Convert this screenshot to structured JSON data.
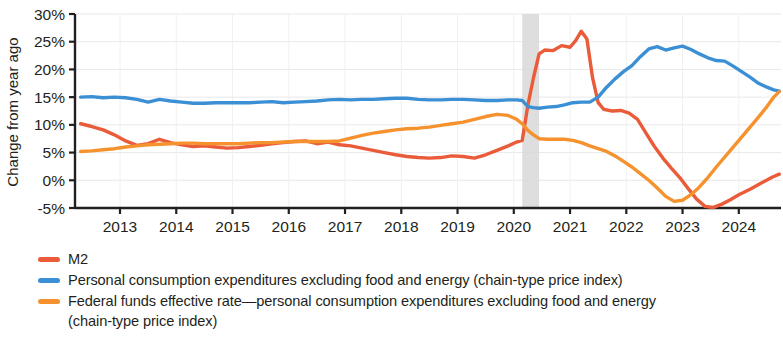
{
  "chart_data": {
    "type": "line",
    "title": "",
    "xlabel": "",
    "ylabel": "Change from year ago",
    "ylim": [
      -5,
      30
    ],
    "xlim": [
      2012.2,
      2024.75
    ],
    "grid": true,
    "legend_position": "below",
    "y_ticks": [
      "30%",
      "25%",
      "20%",
      "15%",
      "10%",
      "5%",
      "0%",
      "-5%"
    ],
    "y_tick_values": [
      30,
      25,
      20,
      15,
      10,
      5,
      0,
      -5
    ],
    "x_ticks": [
      "2013",
      "2014",
      "2015",
      "2016",
      "2017",
      "2018",
      "2019",
      "2020",
      "2021",
      "2022",
      "2023",
      "2024"
    ],
    "x_tick_values": [
      2013,
      2014,
      2015,
      2016,
      2017,
      2018,
      2019,
      2020,
      2021,
      2022,
      2023,
      2024
    ],
    "annotations": [
      {
        "name": "recession-band",
        "type": "vspan",
        "x0": 2020.15,
        "x1": 2020.45,
        "color": "#d8d8d8"
      }
    ],
    "series": [
      {
        "name": "M2",
        "color": "#ea5b3a",
        "x": [
          2012.3,
          2012.5,
          2012.7,
          2012.9,
          2013.1,
          2013.3,
          2013.5,
          2013.7,
          2013.9,
          2014.1,
          2014.3,
          2014.5,
          2014.7,
          2014.9,
          2015.1,
          2015.3,
          2015.5,
          2015.7,
          2015.9,
          2016.1,
          2016.3,
          2016.5,
          2016.7,
          2016.9,
          2017.1,
          2017.3,
          2017.5,
          2017.7,
          2017.9,
          2018.1,
          2018.3,
          2018.5,
          2018.7,
          2018.9,
          2019.1,
          2019.3,
          2019.5,
          2019.7,
          2019.9,
          2020.05,
          2020.15,
          2020.25,
          2020.35,
          2020.45,
          2020.55,
          2020.7,
          2020.85,
          2021.0,
          2021.1,
          2021.2,
          2021.3,
          2021.4,
          2021.5,
          2021.6,
          2021.75,
          2021.9,
          2022.05,
          2022.2,
          2022.35,
          2022.5,
          2022.65,
          2022.8,
          2022.95,
          2023.1,
          2023.25,
          2023.4,
          2023.55,
          2023.7,
          2023.85,
          2024.0,
          2024.2,
          2024.4,
          2024.6,
          2024.72
        ],
        "values": [
          10.2,
          9.7,
          9.1,
          8.2,
          7.1,
          6.3,
          6.6,
          7.4,
          6.8,
          6.4,
          6.1,
          6.2,
          6.0,
          5.8,
          5.9,
          6.1,
          6.3,
          6.6,
          6.8,
          7.0,
          7.1,
          6.6,
          6.9,
          6.4,
          6.2,
          5.8,
          5.4,
          5.0,
          4.6,
          4.3,
          4.1,
          4.0,
          4.1,
          4.4,
          4.3,
          4.0,
          4.6,
          5.4,
          6.2,
          6.9,
          7.2,
          13.5,
          18.5,
          22.8,
          23.5,
          23.4,
          24.3,
          24.0,
          25.2,
          26.9,
          25.5,
          18.5,
          14.0,
          12.8,
          12.5,
          12.6,
          12.1,
          11.0,
          8.5,
          6.1,
          4.0,
          2.2,
          0.5,
          -1.5,
          -3.4,
          -4.7,
          -4.9,
          -4.3,
          -3.5,
          -2.6,
          -1.6,
          -0.5,
          0.6,
          1.1
        ]
      },
      {
        "name": "Personal consumption expenditures excluding food and energy (chain-type price index)",
        "color": "#3b8fd4",
        "x": [
          2012.3,
          2012.5,
          2012.7,
          2012.9,
          2013.1,
          2013.3,
          2013.5,
          2013.7,
          2013.9,
          2014.1,
          2014.3,
          2014.5,
          2014.7,
          2014.9,
          2015.1,
          2015.3,
          2015.5,
          2015.7,
          2015.9,
          2016.1,
          2016.3,
          2016.5,
          2016.7,
          2016.9,
          2017.1,
          2017.3,
          2017.5,
          2017.7,
          2017.9,
          2018.1,
          2018.3,
          2018.5,
          2018.7,
          2018.9,
          2019.1,
          2019.3,
          2019.5,
          2019.7,
          2019.9,
          2020.05,
          2020.15,
          2020.25,
          2020.35,
          2020.45,
          2020.6,
          2020.75,
          2020.9,
          2021.05,
          2021.2,
          2021.35,
          2021.5,
          2021.65,
          2021.8,
          2021.95,
          2022.1,
          2022.25,
          2022.4,
          2022.55,
          2022.7,
          2022.85,
          2023.0,
          2023.15,
          2023.3,
          2023.45,
          2023.6,
          2023.75,
          2023.9,
          2024.05,
          2024.2,
          2024.35,
          2024.5,
          2024.62,
          2024.72
        ],
        "values": [
          15.0,
          15.1,
          14.9,
          15.0,
          14.9,
          14.6,
          14.1,
          14.6,
          14.3,
          14.1,
          13.9,
          13.9,
          14.0,
          14.0,
          14.0,
          14.0,
          14.1,
          14.2,
          14.0,
          14.1,
          14.2,
          14.3,
          14.5,
          14.6,
          14.5,
          14.6,
          14.6,
          14.7,
          14.8,
          14.8,
          14.6,
          14.5,
          14.5,
          14.6,
          14.6,
          14.5,
          14.4,
          14.4,
          14.5,
          14.5,
          14.4,
          13.3,
          13.1,
          13.0,
          13.2,
          13.3,
          13.6,
          14.0,
          14.1,
          14.1,
          15.0,
          16.8,
          18.3,
          19.6,
          20.7,
          22.3,
          23.7,
          24.1,
          23.5,
          23.9,
          24.2,
          23.6,
          22.8,
          22.1,
          21.6,
          21.5,
          20.6,
          19.6,
          18.6,
          17.5,
          16.8,
          16.3,
          16.1
        ]
      },
      {
        "name": "Federal funds effective rate—personal consumption expenditures excluding food and energy (chain-type price index)",
        "color": "#f5922e",
        "x": [
          2012.3,
          2012.5,
          2012.7,
          2012.9,
          2013.1,
          2013.3,
          2013.5,
          2013.7,
          2013.9,
          2014.1,
          2014.3,
          2014.5,
          2014.7,
          2014.9,
          2015.1,
          2015.3,
          2015.5,
          2015.7,
          2015.9,
          2016.1,
          2016.3,
          2016.5,
          2016.7,
          2016.9,
          2017.1,
          2017.3,
          2017.5,
          2017.7,
          2017.9,
          2018.1,
          2018.3,
          2018.5,
          2018.7,
          2018.9,
          2019.1,
          2019.3,
          2019.5,
          2019.7,
          2019.9,
          2020.05,
          2020.15,
          2020.25,
          2020.35,
          2020.45,
          2020.6,
          2020.75,
          2020.9,
          2021.05,
          2021.2,
          2021.35,
          2021.5,
          2021.65,
          2021.8,
          2021.95,
          2022.1,
          2022.25,
          2022.4,
          2022.55,
          2022.7,
          2022.85,
          2023.0,
          2023.15,
          2023.3,
          2023.45,
          2023.6,
          2023.75,
          2023.9,
          2024.05,
          2024.2,
          2024.35,
          2024.5,
          2024.62,
          2024.72
        ],
        "values": [
          5.2,
          5.3,
          5.5,
          5.7,
          6.0,
          6.2,
          6.4,
          6.5,
          6.6,
          6.7,
          6.7,
          6.6,
          6.6,
          6.6,
          6.6,
          6.7,
          6.8,
          6.8,
          6.9,
          7.0,
          7.0,
          7.0,
          7.0,
          7.1,
          7.6,
          8.1,
          8.5,
          8.8,
          9.1,
          9.3,
          9.4,
          9.6,
          9.9,
          10.2,
          10.5,
          11.0,
          11.5,
          11.9,
          11.7,
          11.0,
          10.2,
          9.0,
          8.2,
          7.5,
          7.4,
          7.4,
          7.4,
          7.2,
          6.8,
          6.2,
          5.7,
          5.2,
          4.4,
          3.4,
          2.4,
          1.2,
          0.0,
          -1.4,
          -2.9,
          -3.8,
          -3.6,
          -2.6,
          -1.2,
          0.5,
          2.4,
          4.2,
          6.0,
          7.8,
          9.6,
          11.4,
          13.3,
          15.0,
          16.0
        ]
      }
    ]
  },
  "axis": {
    "y_label": "Change from year ago"
  },
  "legend": {
    "items": [
      {
        "color_name": "m2-red",
        "label": "M2"
      },
      {
        "color_name": "pce-blue",
        "label": "Personal consumption expenditures excluding food and energy (chain-type price index)"
      },
      {
        "color_name": "ffer-orange",
        "label": "Federal funds effective rate—personal consumption expenditures excluding food and energy\n(chain-type price index)"
      }
    ]
  }
}
